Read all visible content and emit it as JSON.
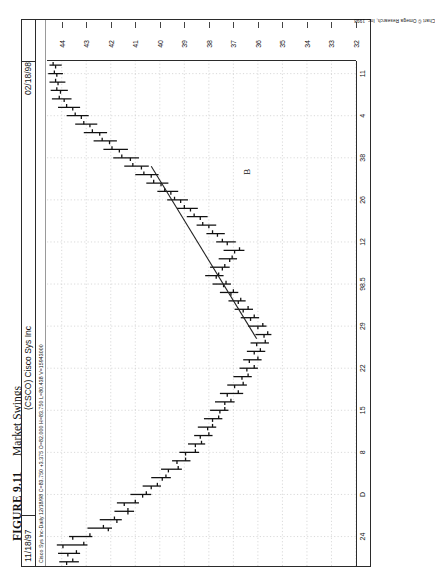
{
  "caption": {
    "figure_number": "FIGURE 9.11",
    "title": "Market Swings"
  },
  "window": {
    "date_left": "11/18/97",
    "symbol_title": "(CSCO) Cisco Sys Inc",
    "date_right": "02/18/98",
    "quote_line": "Cisco Sys Inc-Daily 12/18/98 C=83.750 +3.375 O=82.000 H=83.750 L=80.438 V=15943000",
    "credit": "Chart © Omega Research, Inc. 1998"
  },
  "annotations": [
    {
      "label": "B",
      "x_pct": 77.5,
      "y_pct": 63.0
    }
  ],
  "chart_data": {
    "type": "bar",
    "subtype": "ohlc-bar",
    "title": "(CSCO) Cisco Sys Inc",
    "xlabel": "",
    "ylabel": "",
    "ylim": [
      32,
      44.6
    ],
    "grid": true,
    "legend": "none",
    "orientation": "rotated-90ccw",
    "yticks": [
      44,
      43,
      42,
      41,
      40,
      39,
      38,
      37,
      36,
      35,
      34,
      33,
      32
    ],
    "ytick_labels": [
      "44",
      "43",
      "42",
      "41",
      "40",
      "39",
      "38",
      "37",
      "36",
      "35",
      "34",
      "33",
      "32"
    ],
    "xticks_index": [
      3,
      8,
      13,
      18,
      23,
      28,
      33,
      38,
      43,
      48,
      53,
      58
    ],
    "xtick_labels": [
      "24",
      "D",
      "8",
      "15",
      "22",
      "29",
      "98.5",
      "12",
      "26",
      "38",
      "4",
      "11"
    ],
    "trendline": {
      "label": "B",
      "start_index": 26.5,
      "start_value": 36.05,
      "end_index": 47.0,
      "end_value": 40.35
    },
    "bars": [
      {
        "i": 0,
        "open": 43.8,
        "high": 44.1,
        "low": 43.3,
        "close": 43.55
      },
      {
        "i": 1,
        "open": 43.75,
        "high": 44.15,
        "low": 43.25,
        "close": 43.4
      },
      {
        "i": 2,
        "open": 43.95,
        "high": 44.2,
        "low": 42.95,
        "close": 43.1
      },
      {
        "i": 3,
        "open": 43.55,
        "high": 43.7,
        "low": 42.75,
        "close": 42.85
      },
      {
        "i": 4,
        "open": 42.1,
        "high": 42.95,
        "low": 41.95,
        "close": 42.3
      },
      {
        "i": 5,
        "open": 41.75,
        "high": 42.45,
        "low": 41.55,
        "close": 41.85
      },
      {
        "i": 6,
        "open": 41.3,
        "high": 41.85,
        "low": 41.05,
        "close": 41.3
      },
      {
        "i": 7,
        "open": 41.45,
        "high": 41.75,
        "low": 40.85,
        "close": 41.0
      },
      {
        "i": 8,
        "open": 40.7,
        "high": 41.2,
        "low": 40.35,
        "close": 40.55
      },
      {
        "i": 9,
        "open": 40.35,
        "high": 40.7,
        "low": 39.95,
        "close": 40.1
      },
      {
        "i": 10,
        "open": 39.9,
        "high": 40.35,
        "low": 39.55,
        "close": 39.75
      },
      {
        "i": 11,
        "open": 39.65,
        "high": 39.95,
        "low": 39.1,
        "close": 39.25
      },
      {
        "i": 12,
        "open": 39.3,
        "high": 39.5,
        "low": 38.75,
        "close": 38.95
      },
      {
        "i": 13,
        "open": 38.95,
        "high": 39.2,
        "low": 38.4,
        "close": 38.55
      },
      {
        "i": 14,
        "open": 38.55,
        "high": 38.85,
        "low": 38.15,
        "close": 38.3
      },
      {
        "i": 15,
        "open": 38.35,
        "high": 38.6,
        "low": 37.85,
        "close": 38.0
      },
      {
        "i": 16,
        "open": 38.05,
        "high": 38.45,
        "low": 37.7,
        "close": 37.85
      },
      {
        "i": 17,
        "open": 37.85,
        "high": 38.2,
        "low": 37.45,
        "close": 37.6
      },
      {
        "i": 18,
        "open": 37.55,
        "high": 37.95,
        "low": 37.2,
        "close": 37.35
      },
      {
        "i": 19,
        "open": 37.35,
        "high": 37.75,
        "low": 36.95,
        "close": 37.1
      },
      {
        "i": 20,
        "open": 37.25,
        "high": 37.55,
        "low": 36.6,
        "close": 36.8
      },
      {
        "i": 21,
        "open": 36.95,
        "high": 37.25,
        "low": 36.45,
        "close": 36.6
      },
      {
        "i": 22,
        "open": 36.65,
        "high": 37.0,
        "low": 36.25,
        "close": 36.4
      },
      {
        "i": 23,
        "open": 36.45,
        "high": 36.75,
        "low": 36.0,
        "close": 36.15
      },
      {
        "i": 24,
        "open": 36.35,
        "high": 36.6,
        "low": 35.85,
        "close": 36.0
      },
      {
        "i": 25,
        "open": 36.15,
        "high": 36.45,
        "low": 35.7,
        "close": 35.9
      },
      {
        "i": 26,
        "open": 36.05,
        "high": 36.3,
        "low": 35.55,
        "close": 35.7
      },
      {
        "i": 27,
        "open": 35.75,
        "high": 36.1,
        "low": 35.45,
        "close": 35.6
      },
      {
        "i": 28,
        "open": 36.0,
        "high": 36.4,
        "low": 35.65,
        "close": 35.8
      },
      {
        "i": 29,
        "open": 36.3,
        "high": 36.7,
        "low": 35.95,
        "close": 36.15
      },
      {
        "i": 30,
        "open": 36.6,
        "high": 36.95,
        "low": 36.2,
        "close": 36.4
      },
      {
        "i": 31,
        "open": 36.8,
        "high": 37.2,
        "low": 36.5,
        "close": 36.7
      },
      {
        "i": 32,
        "open": 37.1,
        "high": 37.55,
        "low": 36.8,
        "close": 37.0
      },
      {
        "i": 33,
        "open": 37.4,
        "high": 37.85,
        "low": 37.1,
        "close": 37.3
      },
      {
        "i": 34,
        "open": 37.7,
        "high": 38.15,
        "low": 37.4,
        "close": 37.6
      },
      {
        "i": 35,
        "open": 37.45,
        "high": 37.95,
        "low": 37.15,
        "close": 37.35
      },
      {
        "i": 36,
        "open": 37.15,
        "high": 37.6,
        "low": 36.85,
        "close": 37.05
      },
      {
        "i": 37,
        "open": 36.95,
        "high": 37.4,
        "low": 36.55,
        "close": 36.75
      },
      {
        "i": 38,
        "open": 37.25,
        "high": 37.7,
        "low": 36.9,
        "close": 37.45
      },
      {
        "i": 39,
        "open": 37.65,
        "high": 38.1,
        "low": 37.35,
        "close": 37.85
      },
      {
        "i": 40,
        "open": 38.0,
        "high": 38.5,
        "low": 37.7,
        "close": 38.25
      },
      {
        "i": 41,
        "open": 38.35,
        "high": 38.9,
        "low": 38.05,
        "close": 38.6
      },
      {
        "i": 42,
        "open": 38.75,
        "high": 39.3,
        "low": 38.45,
        "close": 39.0
      },
      {
        "i": 43,
        "open": 39.15,
        "high": 39.7,
        "low": 38.85,
        "close": 39.4
      },
      {
        "i": 44,
        "open": 39.55,
        "high": 40.1,
        "low": 39.25,
        "close": 39.8
      },
      {
        "i": 45,
        "open": 39.95,
        "high": 40.55,
        "low": 39.65,
        "close": 40.25
      },
      {
        "i": 46,
        "open": 40.35,
        "high": 41.0,
        "low": 40.05,
        "close": 40.65
      },
      {
        "i": 47,
        "open": 40.75,
        "high": 41.45,
        "low": 40.45,
        "close": 41.1
      },
      {
        "i": 48,
        "open": 41.2,
        "high": 41.9,
        "low": 40.85,
        "close": 41.55
      },
      {
        "i": 49,
        "open": 41.65,
        "high": 42.3,
        "low": 41.3,
        "close": 41.95
      },
      {
        "i": 50,
        "open": 42.05,
        "high": 42.7,
        "low": 41.75,
        "close": 42.35
      },
      {
        "i": 51,
        "open": 42.45,
        "high": 43.1,
        "low": 42.15,
        "close": 42.75
      },
      {
        "i": 52,
        "open": 42.85,
        "high": 43.45,
        "low": 42.55,
        "close": 43.1
      },
      {
        "i": 53,
        "open": 43.2,
        "high": 43.8,
        "low": 42.9,
        "close": 43.45
      },
      {
        "i": 54,
        "open": 43.55,
        "high": 44.15,
        "low": 43.25,
        "close": 43.8
      },
      {
        "i": 55,
        "open": 43.9,
        "high": 44.4,
        "low": 43.6,
        "close": 44.1
      },
      {
        "i": 56,
        "open": 44.05,
        "high": 44.45,
        "low": 43.75,
        "close": 44.2
      },
      {
        "i": 57,
        "open": 44.15,
        "high": 44.5,
        "low": 43.85,
        "close": 44.25
      },
      {
        "i": 58,
        "open": 44.2,
        "high": 44.55,
        "low": 43.95,
        "close": 44.3
      },
      {
        "i": 59,
        "open": 44.25,
        "high": 44.5,
        "low": 44.0,
        "close": 44.35
      }
    ]
  }
}
